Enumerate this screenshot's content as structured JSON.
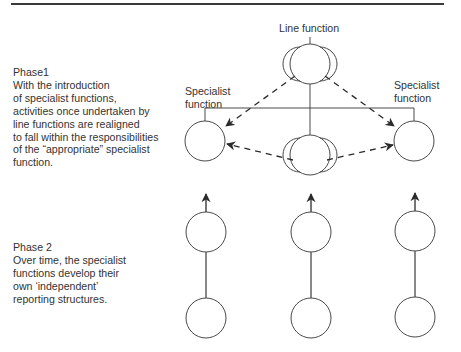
{
  "figure": {
    "phase1": {
      "title": "Phase1",
      "lines": [
        "With the introduction",
        "of specialist functions,",
        "activities once undertaken by",
        "line functions are realigned",
        "to fall within the responsibilities",
        "of the “appropriate” specialist",
        "function."
      ]
    },
    "phase2": {
      "title": "Phase 2",
      "lines": [
        "Over time, the specialist",
        "functions develop their",
        "own ‘independent’",
        "reporting structures."
      ]
    },
    "labels": {
      "line_function": "Line function",
      "specialist_left": [
        "Specialist",
        "function"
      ],
      "specialist_right": [
        "Specialist",
        "function"
      ]
    },
    "colors": {
      "stroke": "#4a4a4a",
      "rule": "#3a3a3a",
      "text": "#333333"
    }
  }
}
